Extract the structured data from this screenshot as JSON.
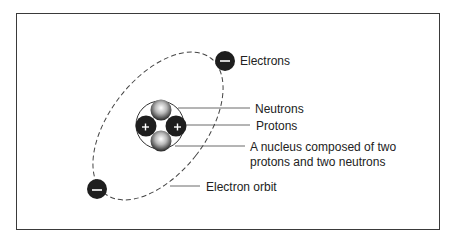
{
  "diagram": {
    "labels": {
      "electrons": "Electrons",
      "neutrons": "Neutrons",
      "protons": "Protons",
      "nucleus_line1": "A nucleus composed of two",
      "nucleus_line2": "protons and two neutrons",
      "orbit": "Electron orbit"
    },
    "symbols": {
      "electron_charge": "−",
      "proton_charge": "+"
    },
    "colors": {
      "frame": "#3a3a3a",
      "particle_dark": "#1e1e1e",
      "neutron_light": "#e8e8e8",
      "text": "#222222",
      "orbit": "#444444"
    }
  }
}
